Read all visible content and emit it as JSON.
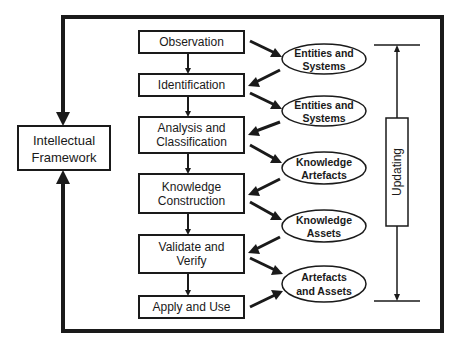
{
  "diagram": {
    "colors": {
      "stroke": "#1a1a1a",
      "background": "#ffffff"
    },
    "side_box": {
      "line1": "Intellectual",
      "line2": "Framework"
    },
    "process_steps": [
      {
        "line1": "Observation",
        "line2": ""
      },
      {
        "line1": "Identification",
        "line2": ""
      },
      {
        "line1": "Analysis and",
        "line2": "Classification"
      },
      {
        "line1": "Knowledge",
        "line2": "Construction"
      },
      {
        "line1": "Validate and",
        "line2": "Verify"
      },
      {
        "line1": "Apply and Use",
        "line2": ""
      }
    ],
    "outputs": [
      {
        "line1": "Entities and",
        "line2": "Systems"
      },
      {
        "line1": "Entities and",
        "line2": "Systems"
      },
      {
        "line1": "Knowledge",
        "line2": "Artefacts"
      },
      {
        "line1": "Knowledge",
        "line2": "Assets"
      },
      {
        "line1": "Artefacts",
        "line2": "and Assets"
      }
    ],
    "updating_label": "Updating"
  }
}
